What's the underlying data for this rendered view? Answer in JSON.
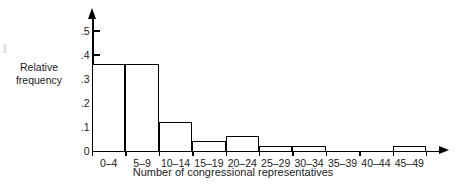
{
  "figure": {
    "background_color": "#ffffff",
    "line_color": "#000000",
    "text_color": "#1b1b1b"
  },
  "axes": {
    "y_axis_label": "Relative\nfrequency",
    "x_axis_label": "Number of congressional representatives",
    "y_tick_labels": [
      "0",
      ".1",
      ".2",
      ".3",
      ".4",
      ".5"
    ],
    "y_tick_values": [
      0,
      0.1,
      0.2,
      0.3,
      0.4,
      0.5
    ]
  },
  "chart_data": {
    "type": "bar",
    "title": "",
    "subtitle": "",
    "xlabel": "Number of congressional representatives",
    "ylabel": "Relative frequency",
    "categories": [
      "0–4",
      "5–9",
      "10–14",
      "15–19",
      "20–24",
      "25–29",
      "30–34",
      "35–39",
      "40–44",
      "45–49"
    ],
    "values": [
      0.36,
      0.36,
      0.12,
      0.04,
      0.06,
      0.02,
      0.02,
      0.0,
      0.0,
      0.02
    ],
    "ylim": [
      0,
      0.55
    ],
    "yticks": [
      0,
      0.1,
      0.2,
      0.3,
      0.4,
      0.5
    ],
    "ytick_labels": [
      "0",
      ".1",
      ".2",
      ".3",
      ".4",
      ".5"
    ],
    "grid": false,
    "legend": false,
    "legend_position": "none",
    "bar_style": "outline",
    "bar_fill": "#ffffff",
    "bar_edge": "#000000"
  }
}
